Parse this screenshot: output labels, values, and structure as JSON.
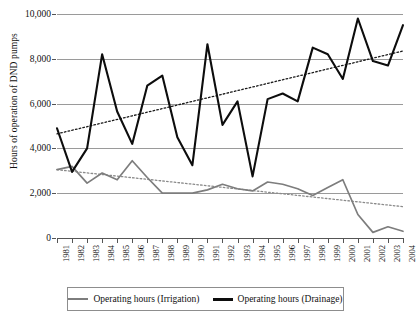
{
  "chart_data": {
    "type": "line",
    "title": "",
    "xlabel": "",
    "ylabel": "Hours of operation of DND pumps",
    "categories": [
      "1981",
      "1982",
      "1983",
      "1984",
      "1985",
      "1986",
      "1987",
      "1988",
      "1989",
      "1990",
      "1991",
      "1992",
      "1993",
      "1994",
      "1995",
      "1996",
      "1997",
      "1998",
      "1999",
      "2000",
      "2001",
      "2002",
      "2003",
      "2004"
    ],
    "ylim": [
      0,
      10000
    ],
    "yticks": [
      0,
      2000,
      4000,
      6000,
      8000,
      10000
    ],
    "ytick_labels": [
      "0",
      "2,000",
      "4,000",
      "6,000",
      "8,000",
      "10,000"
    ],
    "grid": true,
    "legend_position": "bottom",
    "series": [
      {
        "name": "Operating hours (Irrigation)",
        "color": "#7d7d7d",
        "style": "solid",
        "values": [
          3050,
          3200,
          2450,
          2900,
          2600,
          3450,
          2700,
          2000,
          2000,
          2000,
          2150,
          2400,
          2200,
          2100,
          2500,
          2400,
          2200,
          1900,
          2250,
          2600,
          1050,
          250,
          500,
          300
        ]
      },
      {
        "name": "Operating hours (Drainage)",
        "color": "#0d0d0d",
        "style": "solid",
        "values": [
          4900,
          2950,
          4000,
          8200,
          5650,
          4200,
          6800,
          7250,
          4500,
          3250,
          8650,
          5050,
          6100,
          2750,
          6200,
          6450,
          6100,
          8500,
          8200,
          7100,
          9800,
          7900,
          7700,
          9500
        ]
      }
    ],
    "trendlines": [
      {
        "name": "Irrigation trend",
        "for_series": "Operating hours (Irrigation)",
        "color": "#8a8a8a",
        "style": "dotted",
        "start_value": 3050,
        "end_value": 1400
      },
      {
        "name": "Drainage trend",
        "for_series": "Operating hours (Drainage)",
        "color": "#1a1a1a",
        "style": "dotted",
        "start_value": 4650,
        "end_value": 8350
      }
    ]
  },
  "legend": {
    "items": [
      {
        "label": "Operating hours (Irrigation)"
      },
      {
        "label": "Operating hours (Drainage)"
      }
    ]
  }
}
